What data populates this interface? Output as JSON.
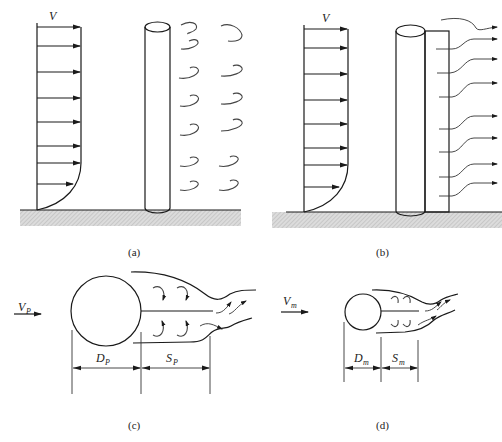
{
  "figure": {
    "panels": [
      {
        "id": "a",
        "caption": "(a)",
        "velocity_label": "V",
        "description": "Prototype pier with boundary-layer velocity profile and shed vortices"
      },
      {
        "id": "b",
        "caption": "(b)",
        "velocity_label": "V",
        "description": "Pier with splitter plate; flow passes without vortex shedding"
      },
      {
        "id": "c",
        "caption": "(c)",
        "velocity_label": "V",
        "velocity_subscript": "P",
        "diameter_label": "D",
        "diameter_subscript": "P",
        "spacing_label": "S",
        "spacing_subscript": "P",
        "description": "Plan view of prototype cylinder wake"
      },
      {
        "id": "d",
        "caption": "(d)",
        "velocity_label": "V",
        "velocity_subscript": "m",
        "diameter_label": "D",
        "diameter_subscript": "m",
        "spacing_label": "S",
        "spacing_subscript": "m",
        "description": "Plan view of model cylinder wake"
      }
    ],
    "colors": {
      "line": "#1a1a1a",
      "hatch_fill": "#d4d4d4",
      "background": "#ffffff"
    }
  }
}
